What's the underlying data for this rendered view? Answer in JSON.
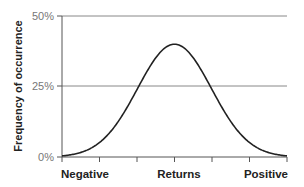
{
  "chart_data": {
    "type": "line",
    "title": "",
    "xlabel": "Returns",
    "ylabel": "Frequency of occurrence",
    "x_categories": [
      "Negative",
      "Returns",
      "Positive"
    ],
    "y_ticks": [
      "0%",
      "25%",
      "50%"
    ],
    "ylim": [
      0,
      50
    ],
    "grid": "horizontal at 25% and 50%",
    "legend": "none",
    "x_tick_count": 7,
    "series": [
      {
        "name": "Return distribution",
        "shape": "bell curve (normal distribution)",
        "x": [
          0,
          0.5,
          1,
          1.5,
          2,
          2.5,
          3,
          3.5,
          4,
          4.5,
          5,
          5.5,
          6
        ],
        "values": [
          0.5,
          1.5,
          3.7,
          8.0,
          15.2,
          25.0,
          35.5,
          40.0,
          35.5,
          25.0,
          15.2,
          8.0,
          3.7
        ],
        "peak_value": 40
      }
    ],
    "colors": {
      "line": "#222222",
      "axis": "#555555",
      "grid": "#888888"
    }
  },
  "labels": {
    "y_0": "0%",
    "y_25": "25%",
    "y_50": "50%",
    "x_left": "Negative",
    "x_center": "Returns",
    "x_right": "Positive",
    "y_axis_title": "Frequency of occurrence"
  }
}
